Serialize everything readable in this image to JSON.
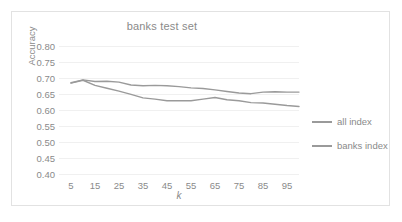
{
  "chart_data": {
    "type": "line",
    "title": "banks test set",
    "xlabel": "k",
    "ylabel": "Accuracy",
    "xlim": [
      0,
      100
    ],
    "ylim": [
      0.4,
      0.8
    ],
    "ytick_labels": [
      "0.80",
      "0.75",
      "0.70",
      "0.65",
      "0.60",
      "0.55",
      "0.50",
      "0.45",
      "0.40"
    ],
    "ytick_values": [
      0.8,
      0.75,
      0.7,
      0.65,
      0.6,
      0.55,
      0.5,
      0.45,
      0.4
    ],
    "xtick_labels": [
      "5",
      "15",
      "25",
      "35",
      "45",
      "55",
      "65",
      "75",
      "85",
      "95"
    ],
    "xtick_values": [
      5,
      15,
      25,
      35,
      45,
      55,
      65,
      75,
      85,
      95
    ],
    "grid": true,
    "legend_position": "right",
    "x": [
      5,
      10,
      15,
      20,
      25,
      30,
      35,
      40,
      45,
      50,
      55,
      60,
      65,
      70,
      75,
      80,
      85,
      90,
      95,
      100
    ],
    "series": [
      {
        "name": "all index",
        "color": "#9a9a9a",
        "values": [
          0.685,
          0.694,
          0.689,
          0.69,
          0.687,
          0.678,
          0.676,
          0.677,
          0.676,
          0.673,
          0.669,
          0.667,
          0.663,
          0.658,
          0.653,
          0.651,
          0.656,
          0.657,
          0.656,
          0.656
        ]
      },
      {
        "name": "banks index",
        "color": "#9a9a9a",
        "values": [
          0.684,
          0.693,
          0.677,
          0.668,
          0.659,
          0.649,
          0.638,
          0.634,
          0.629,
          0.629,
          0.629,
          0.634,
          0.639,
          0.632,
          0.629,
          0.623,
          0.622,
          0.618,
          0.614,
          0.611
        ]
      }
    ]
  },
  "legend": {
    "items": [
      {
        "label": "all index"
      },
      {
        "label": "banks index"
      }
    ]
  }
}
